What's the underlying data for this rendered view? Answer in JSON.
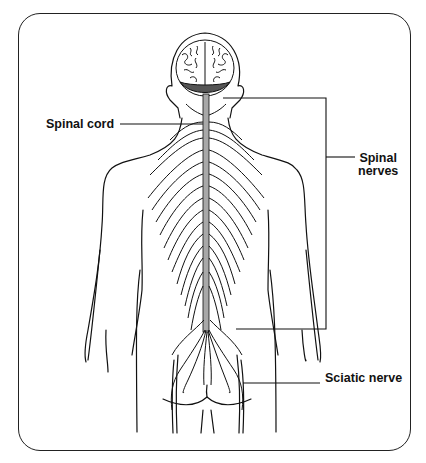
{
  "diagram": {
    "labels": {
      "spinal_cord": "Spinal cord",
      "spinal_nerves_line1": "Spinal",
      "spinal_nerves_line2": "nerves",
      "sciatic_nerve": "Sciatic nerve"
    },
    "colors": {
      "line": "#111111",
      "spinal_cord_fill": "#a8a8a8",
      "background": "#ffffff",
      "cerebellum_shade": "#555555"
    }
  }
}
